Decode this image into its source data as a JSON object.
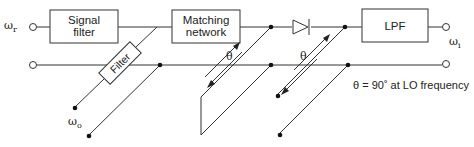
{
  "diagram": {
    "type": "single-balanced mixer schematic with transmission-line stubs",
    "inputs": {
      "rf_label": "ω",
      "rf_sub": "r",
      "lo_label": "ω",
      "lo_sub": "o"
    },
    "outputs": {
      "if_label": "ω",
      "if_sub": "i"
    },
    "blocks": {
      "signal_filter": [
        "Signal",
        "filter"
      ],
      "matching_network": [
        "Matching",
        "network"
      ],
      "lpf": "LPF",
      "lo_filter": "Filter"
    },
    "stub_labels": {
      "theta_1": "θ",
      "theta_2": "θ"
    },
    "note": "θ = 90˚ at LO frequency"
  }
}
